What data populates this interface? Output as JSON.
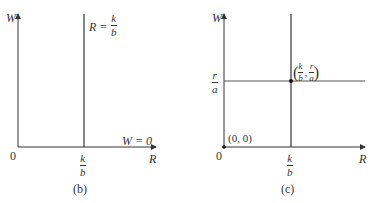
{
  "panels": [
    {
      "id": "b",
      "caption": "(b)",
      "y_axis_label": "W",
      "x_axis_label": "R",
      "origin_label": "0",
      "vertical_line": {
        "label_lhs": "R =",
        "num": "k",
        "den": "b"
      },
      "horizontal_line_label": "W = 0",
      "x_tick": {
        "num": "k",
        "den": "b"
      }
    },
    {
      "id": "c",
      "caption": "(c)",
      "y_axis_label": "W",
      "x_axis_label": "R",
      "origin_label": "0",
      "origin_point_label": "(0, 0)",
      "x_tick": {
        "num": "k",
        "den": "b"
      },
      "y_tick": {
        "num": "r",
        "den": "a"
      },
      "equilibrium_point": {
        "open": "(",
        "x_num": "k",
        "x_den": "b",
        "sep": ",",
        "y_num": "r",
        "y_den": "a",
        "close": ")"
      }
    }
  ]
}
